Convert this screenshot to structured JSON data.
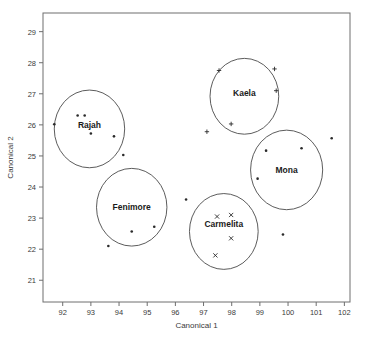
{
  "chart_data": {
    "type": "scatter",
    "title": "",
    "xlabel": "Canonical 1",
    "ylabel": "Canonical 2",
    "xlim": [
      91.3,
      102.2
    ],
    "ylim": [
      20.3,
      29.6
    ],
    "xticks": [
      92,
      93,
      94,
      95,
      96,
      97,
      98,
      99,
      100,
      101,
      102
    ],
    "xtick_labels": [
      "92",
      "93",
      "94",
      "95",
      "96",
      "97",
      "98",
      "99",
      "100",
      "101",
      "102"
    ],
    "yticks": [
      21,
      22,
      23,
      24,
      25,
      26,
      27,
      28,
      29
    ],
    "ytick_labels": [
      "21",
      "22",
      "23",
      "24",
      "25",
      "26",
      "27",
      "28",
      "29"
    ],
    "grid": false,
    "legend": "none",
    "frame": true,
    "clusters": [
      {
        "name": "Rajah",
        "marker": "dot",
        "label_x": 92.95,
        "label_y": 26.0,
        "circle_cx": 92.95,
        "circle_cy": 25.87,
        "circle_rx": 1.25,
        "circle_ry": 1.25,
        "points": [
          {
            "x": 92.53,
            "y": 26.3
          },
          {
            "x": 92.78,
            "y": 26.3
          },
          {
            "x": 91.7,
            "y": 26.02
          },
          {
            "x": 93.0,
            "y": 25.72
          },
          {
            "x": 93.82,
            "y": 25.63
          },
          {
            "x": 94.15,
            "y": 25.03
          }
        ]
      },
      {
        "name": "Kaela",
        "marker": "plus",
        "label_x": 98.45,
        "label_y": 27.03,
        "circle_cx": 98.45,
        "circle_cy": 26.92,
        "circle_rx": 1.22,
        "circle_ry": 1.22,
        "points": [
          {
            "x": 97.55,
            "y": 27.75
          },
          {
            "x": 99.52,
            "y": 27.8
          },
          {
            "x": 99.58,
            "y": 27.1
          },
          {
            "x": 97.98,
            "y": 26.03
          },
          {
            "x": 97.12,
            "y": 25.78
          }
        ]
      },
      {
        "name": "Mona",
        "marker": "dot",
        "label_x": 99.95,
        "label_y": 24.55,
        "circle_cx": 99.95,
        "circle_cy": 24.55,
        "circle_rx": 1.28,
        "circle_ry": 1.28,
        "points": [
          {
            "x": 99.22,
            "y": 25.17
          },
          {
            "x": 100.48,
            "y": 25.25
          },
          {
            "x": 101.55,
            "y": 25.57
          },
          {
            "x": 98.92,
            "y": 24.27
          },
          {
            "x": 99.82,
            "y": 22.47
          }
        ]
      },
      {
        "name": "Fenimore",
        "marker": "dot",
        "label_x": 94.45,
        "label_y": 23.35,
        "circle_cx": 94.45,
        "circle_cy": 23.35,
        "circle_rx": 1.25,
        "circle_ry": 1.25,
        "points": [
          {
            "x": 94.45,
            "y": 22.57
          },
          {
            "x": 95.25,
            "y": 22.72
          },
          {
            "x": 93.62,
            "y": 22.1
          }
        ]
      },
      {
        "name": "Carmelita",
        "marker": "cross",
        "label_x": 97.72,
        "label_y": 22.8,
        "circle_cx": 97.72,
        "circle_cy": 22.57,
        "circle_rx": 1.22,
        "circle_ry": 1.22,
        "points": [
          {
            "x": 97.48,
            "y": 23.05
          },
          {
            "x": 97.98,
            "y": 23.1
          },
          {
            "x": 97.98,
            "y": 22.35
          },
          {
            "x": 97.42,
            "y": 21.8
          }
        ]
      }
    ],
    "unclustered_points": [
      {
        "x": 96.38,
        "y": 23.6,
        "marker": "dot"
      }
    ]
  }
}
